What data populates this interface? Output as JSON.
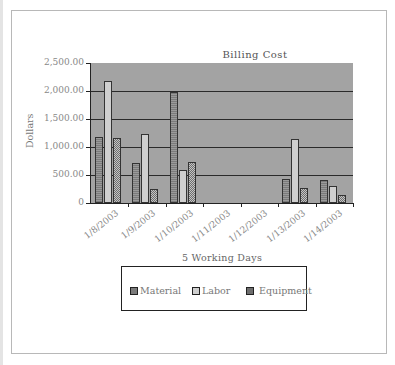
{
  "chart_data": {
    "type": "bar",
    "title": "Billing Cost",
    "xlabel": "5 Working Days",
    "ylabel": "Dollars",
    "ylim": [
      0,
      2500
    ],
    "yticks": [
      "0",
      "500.00",
      "1,000.00",
      "1,500.00",
      "2,000.00",
      "2,500.00"
    ],
    "grid": true,
    "legend_position": "bottom",
    "categories": [
      "1/8/2003",
      "1/9/2003",
      "1/10/2003",
      "1/11/2003",
      "1/12/2003",
      "1/13/2003",
      "1/14/2003"
    ],
    "series": [
      {
        "name": "Material",
        "values": [
          1170,
          720,
          1980,
          0,
          0,
          430,
          410
        ]
      },
      {
        "name": "Labor",
        "values": [
          2170,
          1230,
          590,
          0,
          0,
          1140,
          300
        ]
      },
      {
        "name": "Equipment",
        "values": [
          1160,
          250,
          730,
          0,
          0,
          270,
          140
        ]
      }
    ]
  },
  "legend": {
    "items": [
      {
        "label": "Material"
      },
      {
        "label": "Labor"
      },
      {
        "label": "Equipment"
      }
    ]
  }
}
